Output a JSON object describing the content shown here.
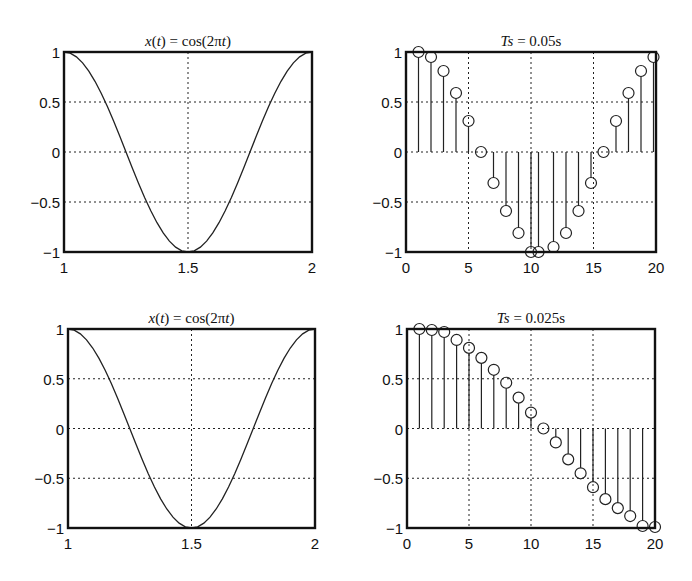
{
  "figure": {
    "width": 692,
    "height": 581
  },
  "chart_data": [
    {
      "id": "top-left",
      "type": "line",
      "title": "x(t) = cos(2πt)",
      "title_parts": [
        {
          "text": "x",
          "italic": true
        },
        {
          "text": "(",
          "italic": false
        },
        {
          "text": "t",
          "italic": true
        },
        {
          "text": ") = cos(2π",
          "italic": false
        },
        {
          "text": "t",
          "italic": true
        },
        {
          "text": ")",
          "italic": false
        }
      ],
      "box": {
        "left": 64,
        "top": 52,
        "right": 312,
        "bottom": 252
      },
      "xlim": [
        1,
        2
      ],
      "ylim": [
        -1,
        1
      ],
      "xticks": [
        1,
        1.5,
        2
      ],
      "xtick_labels": [
        "1",
        "1.5",
        "2"
      ],
      "yticks": [
        1,
        0.5,
        0,
        -0.5,
        -1
      ],
      "ytick_labels": [
        "1",
        "0.5",
        "0",
        "−0.5",
        "−1"
      ],
      "grid": true,
      "xgrid": [
        1.5
      ],
      "ygrid": [
        0.5,
        0,
        -0.5
      ],
      "function": "cos(2*pi*t)",
      "sample_step": 0.025,
      "xlabel": "",
      "ylabel": ""
    },
    {
      "id": "top-right",
      "type": "stem",
      "title": "Ts = 0.05s",
      "title_parts": [
        {
          "text": "Ts",
          "italic": true
        },
        {
          "text": " = 0.05s",
          "italic": false
        }
      ],
      "box": {
        "left": 406,
        "top": 52,
        "right": 656,
        "bottom": 252
      },
      "xlim": [
        0,
        20
      ],
      "ylim": [
        -1,
        1
      ],
      "xticks": [
        0,
        5,
        10,
        15,
        20
      ],
      "xtick_labels": [
        "0",
        "5",
        "10",
        "15",
        "20"
      ],
      "yticks": [
        1,
        0.5,
        0,
        -0.5,
        -1
      ],
      "ytick_labels": [
        "1",
        "0.5",
        "0",
        "−0.5",
        "−1"
      ],
      "grid": true,
      "xgrid": [
        5,
        10,
        15
      ],
      "ygrid": [
        0.5,
        0,
        -0.5
      ],
      "x": [
        1,
        2,
        3,
        4,
        5,
        6,
        7,
        8,
        9,
        10,
        10.6,
        11.8,
        12.8,
        13.8,
        14.8,
        15.8,
        16.8,
        17.8,
        18.8,
        19.8
      ],
      "values": [
        1.0,
        0.95,
        0.81,
        0.59,
        0.31,
        0.0,
        -0.31,
        -0.59,
        -0.81,
        -1.0,
        -1.0,
        -0.95,
        -0.81,
        -0.59,
        -0.31,
        0.0,
        0.31,
        0.59,
        0.81,
        0.95
      ],
      "xlabel": "",
      "ylabel": ""
    },
    {
      "id": "bottom-left",
      "type": "line",
      "title": "x(t) = cos(2πt)",
      "title_parts": [
        {
          "text": "x",
          "italic": true
        },
        {
          "text": "(",
          "italic": false
        },
        {
          "text": "t",
          "italic": true
        },
        {
          "text": ") = cos(2π",
          "italic": false
        },
        {
          "text": "t",
          "italic": true
        },
        {
          "text": ")",
          "italic": false
        }
      ],
      "box": {
        "left": 68,
        "top": 329,
        "right": 315,
        "bottom": 528
      },
      "xlim": [
        1,
        2
      ],
      "ylim": [
        -1,
        1
      ],
      "xticks": [
        1,
        1.5,
        2
      ],
      "xtick_labels": [
        "1",
        "1.5",
        "2"
      ],
      "yticks": [
        1,
        0.5,
        0,
        -0.5,
        -1
      ],
      "ytick_labels": [
        "1",
        "0.5",
        "0",
        "−0.5",
        "−1"
      ],
      "grid": true,
      "xgrid": [
        1.5
      ],
      "ygrid": [
        0.5,
        0,
        -0.5
      ],
      "function": "cos(2*pi*t)",
      "sample_step": 0.025,
      "xlabel": "",
      "ylabel": ""
    },
    {
      "id": "bottom-right",
      "type": "stem",
      "title": "Ts = 0.025s",
      "title_parts": [
        {
          "text": "Ts",
          "italic": true
        },
        {
          "text": " = 0.025s",
          "italic": false
        }
      ],
      "box": {
        "left": 407,
        "top": 329,
        "right": 655,
        "bottom": 528
      },
      "xlim": [
        0,
        20
      ],
      "ylim": [
        -1,
        1
      ],
      "xticks": [
        0,
        5,
        10,
        15,
        20
      ],
      "xtick_labels": [
        "0",
        "5",
        "10",
        "15",
        "20"
      ],
      "yticks": [
        1,
        0.5,
        0,
        -0.5,
        -1
      ],
      "ytick_labels": [
        "1",
        "0.5",
        "0",
        "−0.5",
        "−1"
      ],
      "grid": true,
      "xgrid": [
        5,
        10,
        15
      ],
      "ygrid": [
        0.5,
        0,
        -0.5
      ],
      "x": [
        1,
        2,
        3,
        4,
        5,
        6,
        7,
        8,
        9,
        10,
        11,
        12,
        13,
        14,
        15,
        16,
        17,
        18,
        19,
        20
      ],
      "values": [
        1.0,
        0.99,
        0.97,
        0.89,
        0.81,
        0.71,
        0.59,
        0.46,
        0.31,
        0.16,
        0.0,
        -0.14,
        -0.31,
        -0.45,
        -0.59,
        -0.71,
        -0.8,
        -0.88,
        -0.98,
        -0.99
      ],
      "xlabel": "",
      "ylabel": ""
    }
  ]
}
